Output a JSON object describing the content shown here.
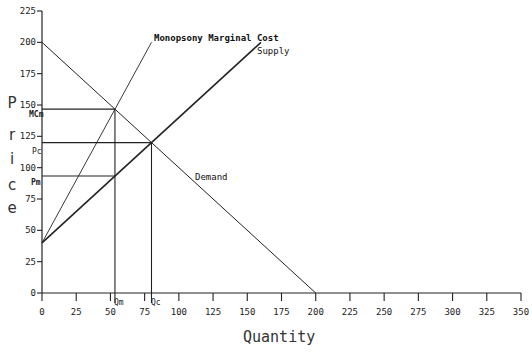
{
  "chart_data": {
    "type": "line",
    "title": "",
    "xlabel": "Quantity",
    "ylabel": "Price",
    "xlim": [
      0,
      350
    ],
    "ylim": [
      0,
      225
    ],
    "grid": false,
    "x_ticks": [
      0,
      25,
      50,
      75,
      100,
      125,
      150,
      175,
      200,
      225,
      250,
      275,
      300,
      325,
      350
    ],
    "y_ticks": [
      0,
      25,
      50,
      75,
      100,
      125,
      150,
      175,
      200,
      225
    ],
    "series": [
      {
        "name": "Demand",
        "points": [
          [
            0,
            200
          ],
          [
            200,
            0
          ]
        ]
      },
      {
        "name": "Supply",
        "points": [
          [
            0,
            40
          ],
          [
            160,
            200
          ]
        ]
      },
      {
        "name": "Monopsony Marginal Cost",
        "points": [
          [
            0,
            40
          ],
          [
            80,
            200
          ]
        ]
      }
    ],
    "reference_lines": [
      {
        "label": "MCm",
        "axis": "y",
        "value": 146.7,
        "x_to": 53.3
      },
      {
        "label": "Pc",
        "axis": "y",
        "value": 120,
        "x_to": 80
      },
      {
        "label": "Pm",
        "axis": "y",
        "value": 93.3,
        "x_to": 53.3
      },
      {
        "label": "Qm",
        "axis": "x",
        "value": 53.3,
        "y_to": 146.7
      },
      {
        "label": "Qc",
        "axis": "x",
        "value": 80,
        "y_to": 120
      }
    ],
    "annotations": [
      {
        "text": "Monopsony Marginal Cost",
        "near": [
          82,
          202
        ]
      },
      {
        "text": "Supply",
        "near": [
          158,
          197
        ]
      },
      {
        "text": "Demand",
        "near": [
          116,
          85
        ]
      }
    ]
  },
  "labels": {
    "xlabel": "Quantity",
    "ylabel_chars": [
      "P",
      "r",
      "i",
      "c",
      "e"
    ],
    "mc_curve": "Monopsony Marginal Cost",
    "supply_curve": "Supply",
    "demand_curve": "Demand",
    "mcm": "MCm",
    "pc": "Pc",
    "pm": "Pm",
    "qm": "Qm",
    "qc": "Qc"
  },
  "ticks": {
    "x": [
      "0",
      "25",
      "50",
      "75",
      "100",
      "125",
      "150",
      "175",
      "200",
      "225",
      "250",
      "275",
      "300",
      "325",
      "350"
    ],
    "y": [
      "0",
      "25",
      "50",
      "75",
      "100",
      "125",
      "150",
      "175",
      "200",
      "225"
    ]
  }
}
